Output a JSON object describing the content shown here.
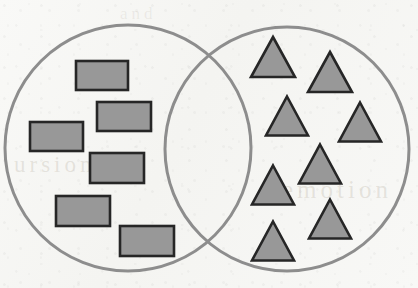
{
  "figure": {
    "width": 418,
    "height": 288,
    "background_color": "#f7f7f5"
  },
  "style": {
    "circle_stroke": "#8d8d8d",
    "circle_stroke_width": 3,
    "circle_fill": "none",
    "shape_fill": "#989898",
    "shape_stroke": "#262626",
    "shape_stroke_width": 2.6
  },
  "circles": [
    {
      "name": "left-set-circle",
      "label": "rectangles set",
      "cx": 128,
      "cy": 148,
      "r": 123
    },
    {
      "name": "right-set-circle",
      "label": "triangles set",
      "cx": 287,
      "cy": 149,
      "r": 122
    }
  ],
  "intersection": {
    "name": "overlap-region",
    "contents": "empty",
    "count": 0,
    "top_crossing": {
      "x": 207,
      "y": 48
    },
    "bottom_crossing": {
      "x": 207,
      "y": 253
    }
  },
  "rectangles": {
    "set": "left",
    "count": 6,
    "fill": "#989898",
    "stroke": "#262626",
    "items": [
      {
        "x": 76,
        "y": 61,
        "w": 52,
        "h": 29,
        "rotation": 0
      },
      {
        "x": 97,
        "y": 102,
        "w": 54,
        "h": 29,
        "rotation": 0
      },
      {
        "x": 30,
        "y": 122,
        "w": 53,
        "h": 29,
        "rotation": 0
      },
      {
        "x": 90,
        "y": 153,
        "w": 54,
        "h": 30,
        "rotation": 0
      },
      {
        "x": 56,
        "y": 196,
        "w": 54,
        "h": 30,
        "rotation": 0
      },
      {
        "x": 120,
        "y": 226,
        "w": 54,
        "h": 30,
        "rotation": 0
      }
    ]
  },
  "triangles": {
    "set": "right",
    "count": 10,
    "fill": "#989898",
    "stroke": "#262626",
    "items": [
      {
        "cx": 273,
        "cy": 57,
        "w": 44,
        "h": 40
      },
      {
        "cx": 330,
        "cy": 72,
        "w": 44,
        "h": 40
      },
      {
        "cx": 287,
        "cy": 116,
        "w": 42,
        "h": 39
      },
      {
        "cx": 360,
        "cy": 122,
        "w": 42,
        "h": 39
      },
      {
        "cx": 320,
        "cy": 164,
        "w": 42,
        "h": 39
      },
      {
        "cx": 273,
        "cy": 185,
        "w": 42,
        "h": 39
      },
      {
        "cx": 330,
        "cy": 219,
        "w": 42,
        "h": 39
      },
      {
        "cx": 273,
        "cy": 241,
        "w": 42,
        "h": 39
      }
    ],
    "items_extra": [
      {
        "cx": 287,
        "cy": 116,
        "w": 42,
        "h": 39
      },
      {
        "cx": 360,
        "cy": 122,
        "w": 42,
        "h": 39
      }
    ]
  },
  "bleed_text": {
    "left": "ursion",
    "right": "emotion",
    "top": "and"
  }
}
